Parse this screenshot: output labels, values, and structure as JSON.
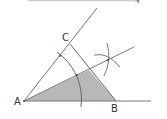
{
  "diagram": {
    "type": "angle-bisector-construction",
    "labels": {
      "a": "A",
      "b": "B",
      "c": "C"
    },
    "colors": {
      "line": "#666666",
      "fill": "#b8b8b8",
      "label": "#333333",
      "header_start": "#e8e8e8",
      "header_end": "#7a7a7a"
    }
  }
}
